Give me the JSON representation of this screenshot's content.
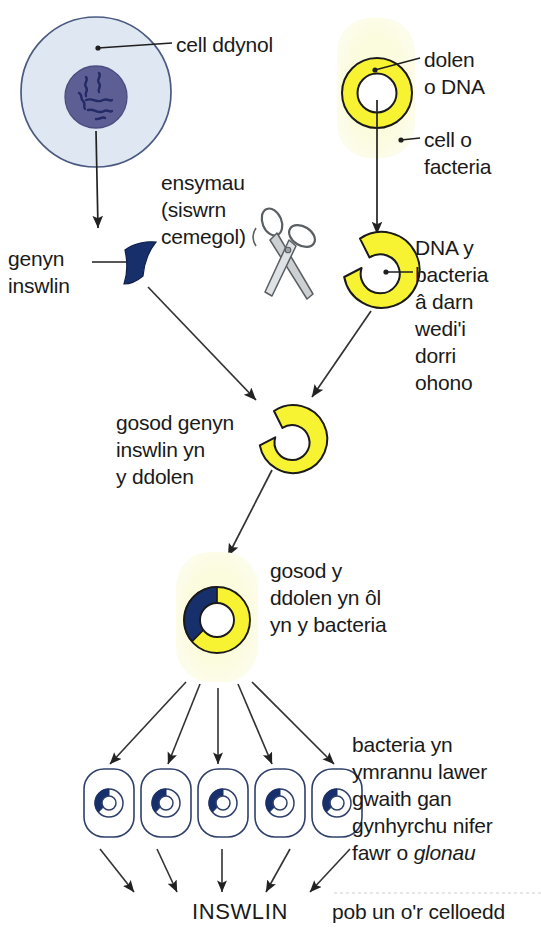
{
  "diagram": {
    "labels": {
      "cell_ddynol": "cell ddynol",
      "dolen_o_dna": "dolen\no DNA",
      "cell_o_facteria": "cell o\nfacteria",
      "ensymau": "ensymau\n(siswrn\ncemegol)",
      "genyn_inswlin": "genyn\ninswlin",
      "dna_y_bacteria": "DNA y\nbacteria\nâ darn\nwedi'i\ndorri\nohono",
      "gosod_genyn": "gosod genyn\ninswlin yn\ny ddolen",
      "gosod_y_ddolen": "gosod y\nddolen yn ôl\nyn y bacteria",
      "bacteria_ymrannu_line1": "bacteria yn",
      "bacteria_ymrannu_line2": "ymrannu lawer",
      "bacteria_ymrannu_line3": "gwaith gan",
      "bacteria_ymrannu_line4": "gynhyrchu nifer",
      "bacteria_ymrannu_line5_pre": "fawr o ",
      "bacteria_ymrannu_line5_em": "glonau",
      "inswlin": "INSWLIN",
      "pob_un_or_celloedd": "pob un o'r celloedd"
    },
    "icons": {
      "human_cell": "human-cell-icon",
      "nucleus": "nucleus-icon",
      "bacteria_cell": "bacteria-cell-icon",
      "plasmid_ring": "plasmid-dna-loop-icon",
      "scissors": "scissors-icon",
      "insulin_gene": "insulin-gene-fragment-icon",
      "cut_plasmid": "cut-plasmid-ring-icon",
      "recombinant_plasmid": "recombinant-plasmid-icon",
      "daughter_cell": "daughter-bacteria-cell-icon"
    },
    "colors": {
      "human_cell_fill": "#dfe7f2",
      "human_cell_stroke": "#4a5a80",
      "nucleus_fill": "#5d5f94",
      "nucleus_stroke": "#4b4d7e",
      "chromatin": "#2b3170",
      "bacteria_fill": "#fbfbdf",
      "bacteria_glow": "#fdfdea",
      "plasmid_fill": "#f7f333",
      "plasmid_stroke": "#1a1a1a",
      "insulin_gene_fill": "#17306b",
      "scissors_fill": "#c9ccce",
      "scissors_stroke": "#5a5f63",
      "arrow": "#222222",
      "text": "#1a1a1a",
      "daughter_stroke": "#30406b"
    },
    "counts": {
      "daughter_cells": 5,
      "division_arrows": 5,
      "insulin_arrows": 5
    }
  }
}
